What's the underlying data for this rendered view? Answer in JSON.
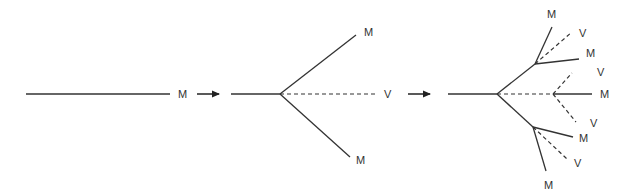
{
  "diagram": {
    "colors": {
      "line": "#333333",
      "background": "#ffffff"
    },
    "stage1": {
      "stem_label": "M"
    },
    "stage2": {
      "labels": {
        "upper": "M",
        "middle": "V",
        "lower": "M"
      }
    },
    "stage3": {
      "labels": {
        "top_m": "M",
        "top_v": "V",
        "upper_m": "M",
        "upper_v": "V",
        "center_m": "M",
        "lower_v1": "V",
        "lower_m": "M",
        "lower_v2": "V",
        "bottom_m": "M"
      }
    },
    "arrows": [
      "arrow-right-icon",
      "arrow-right-icon"
    ]
  }
}
